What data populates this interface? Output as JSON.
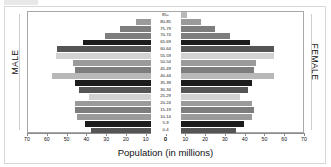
{
  "figure": {
    "axis_title": "Population (in millions)",
    "male_label": "MALE",
    "female_label": "FEMALE"
  },
  "colors": {
    "dark": "#1c1c1c",
    "medium_dark": "#555555",
    "medium": "#7d7d7d",
    "medium_light": "#9a9a9a",
    "light": "#b8b8b8",
    "very_light": "#d2d2d2",
    "axis": "#8a8a8a",
    "panel_border": "#a8a8a8",
    "frame": "#d7d7d7",
    "text": "#111111"
  },
  "chart_data": {
    "type": "bar",
    "title": "",
    "subtitle": "",
    "xlabel": "Population (in millions)",
    "ylabel": "",
    "orientation": "horizontal",
    "layout": "population-pyramid",
    "grid": false,
    "legend": null,
    "xlim_left": [
      70,
      0
    ],
    "xlim_right": [
      0,
      70
    ],
    "xticks_left": [
      70,
      60,
      50,
      40,
      30,
      20,
      10,
      0
    ],
    "xticks_right": [
      0,
      10,
      20,
      30,
      40,
      50,
      60,
      70
    ],
    "categories": [
      "85+",
      "80-85",
      "75-79",
      "70-74",
      "65-69",
      "60-64",
      "55-59",
      "50-54",
      "45-49",
      "40-44",
      "35-39",
      "30-34",
      "25-29",
      "20-24",
      "15-19",
      "10-14",
      "5-9",
      "0-4"
    ],
    "series": [
      {
        "name": "MALE",
        "side": "left",
        "values": [
          7,
          15,
          23,
          31,
          42,
          55,
          56,
          47,
          46,
          58,
          46,
          44,
          39,
          46,
          46,
          45,
          41,
          38
        ]
      },
      {
        "name": "FEMALE",
        "side": "right",
        "values": [
          11,
          18,
          25,
          33,
          43,
          55,
          55,
          46,
          45,
          55,
          44,
          42,
          38,
          44,
          45,
          44,
          40,
          36
        ]
      }
    ],
    "bar_shades": [
      "#b8b8b8",
      "#9a9a9a",
      "#7d7d7d",
      "#7d7d7d",
      "#1c1c1c",
      "#555555",
      "#d2d2d2",
      "#9a9a9a",
      "#7d7d7d",
      "#b8b8b8",
      "#1c1c1c",
      "#555555",
      "#d2d2d2",
      "#9a9a9a",
      "#7d7d7d",
      "#9a9a9a",
      "#1c1c1c",
      "#555555"
    ]
  }
}
